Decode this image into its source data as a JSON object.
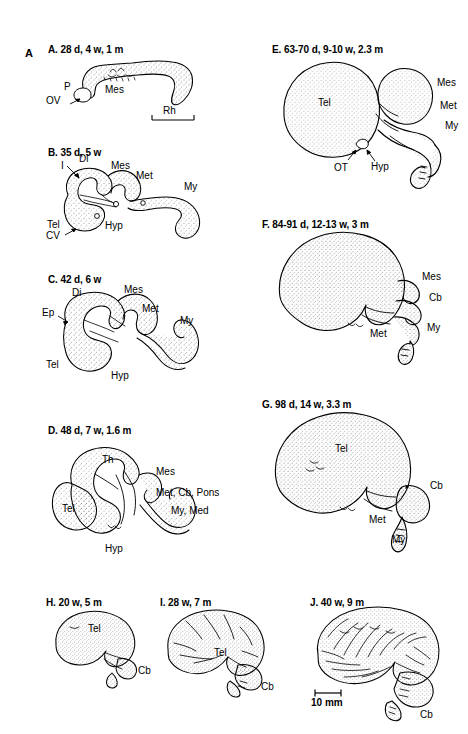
{
  "figure": {
    "letter": "A",
    "background_color": "#ffffff",
    "ink_color": "#000000",
    "scale_bar": {
      "label": "10 mm",
      "panel": "J"
    }
  },
  "panels": [
    {
      "id": "A",
      "heading": "A. 28 d, 4 w, 1 m",
      "labels": [
        {
          "key": "p",
          "text": "P"
        },
        {
          "key": "ov",
          "text": "OV"
        },
        {
          "key": "mes",
          "text": "Mes"
        },
        {
          "key": "rh",
          "text": "Rh"
        }
      ]
    },
    {
      "id": "B",
      "heading": "B. 35 d, 5 w",
      "labels": [
        {
          "key": "i",
          "text": "I"
        },
        {
          "key": "di",
          "text": "Di"
        },
        {
          "key": "mes",
          "text": "Mes"
        },
        {
          "key": "met",
          "text": "Met"
        },
        {
          "key": "my",
          "text": "My"
        },
        {
          "key": "tel",
          "text": "Tel"
        },
        {
          "key": "cv",
          "text": "CV"
        },
        {
          "key": "hyp",
          "text": "Hyp"
        }
      ]
    },
    {
      "id": "C",
      "heading": "C. 42 d, 6 w",
      "labels": [
        {
          "key": "di",
          "text": "Di"
        },
        {
          "key": "ep",
          "text": "Ep"
        },
        {
          "key": "mes",
          "text": "Mes"
        },
        {
          "key": "met",
          "text": "Met"
        },
        {
          "key": "my",
          "text": "My"
        },
        {
          "key": "tel",
          "text": "Tel"
        },
        {
          "key": "hyp",
          "text": "Hyp"
        }
      ]
    },
    {
      "id": "D",
      "heading": "D. 48 d, 7 w, 1.6 m",
      "labels": [
        {
          "key": "th",
          "text": "Th"
        },
        {
          "key": "mes",
          "text": "Mes"
        },
        {
          "key": "metcbpons",
          "text": "Met, Cb, Pons"
        },
        {
          "key": "mymed",
          "text": "My, Med"
        },
        {
          "key": "tel",
          "text": "Tel"
        },
        {
          "key": "hyp",
          "text": "Hyp"
        }
      ]
    },
    {
      "id": "E",
      "heading": "E. 63-70 d, 9-10 w, 2.3 m",
      "labels": [
        {
          "key": "tel",
          "text": "Tel"
        },
        {
          "key": "mes",
          "text": "Mes"
        },
        {
          "key": "met",
          "text": "Met"
        },
        {
          "key": "my",
          "text": "My"
        },
        {
          "key": "ot",
          "text": "OT"
        },
        {
          "key": "hyp",
          "text": "Hyp"
        }
      ]
    },
    {
      "id": "F",
      "heading": "F. 84-91 d, 12-13 w, 3 m",
      "labels": [
        {
          "key": "mes",
          "text": "Mes"
        },
        {
          "key": "cb",
          "text": "Cb"
        },
        {
          "key": "met",
          "text": "Met"
        },
        {
          "key": "my",
          "text": "My"
        }
      ]
    },
    {
      "id": "G",
      "heading": "G. 98 d, 14 w, 3.3 m",
      "labels": [
        {
          "key": "tel",
          "text": "Tel"
        },
        {
          "key": "cb",
          "text": "Cb"
        },
        {
          "key": "met",
          "text": "Met"
        },
        {
          "key": "my",
          "text": "My"
        }
      ]
    },
    {
      "id": "H",
      "heading": "H. 20 w, 5 m",
      "labels": [
        {
          "key": "tel",
          "text": "Tel"
        },
        {
          "key": "cb",
          "text": "Cb"
        }
      ]
    },
    {
      "id": "I",
      "heading": "I. 28 w, 7 m",
      "labels": [
        {
          "key": "tel",
          "text": "Tel"
        },
        {
          "key": "cb",
          "text": "Cb"
        }
      ]
    },
    {
      "id": "J",
      "heading": "J. 40 w, 9 m",
      "labels": [
        {
          "key": "cb",
          "text": "Cb"
        }
      ]
    }
  ]
}
